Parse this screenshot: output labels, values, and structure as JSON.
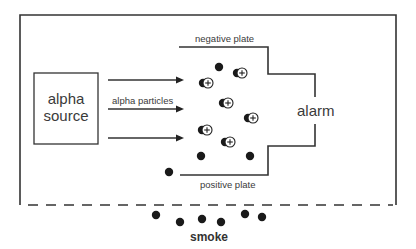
{
  "diagram": {
    "labels": {
      "source": "alpha source",
      "source_line1": "alpha",
      "source_line2": "source",
      "particles": "alpha particles",
      "negative_plate": "negative plate",
      "positive_plate": "positive plate",
      "alarm": "alarm",
      "smoke": "smoke"
    },
    "colors": {
      "line": "#333333",
      "particle": "#1a1a1a",
      "background": "#ffffff"
    },
    "ion_pairs": [
      {
        "x": 208,
        "y": 83
      },
      {
        "x": 242,
        "y": 73
      },
      {
        "x": 228,
        "y": 103
      },
      {
        "x": 253,
        "y": 118
      },
      {
        "x": 207,
        "y": 130
      },
      {
        "x": 230,
        "y": 142
      }
    ],
    "neutral_particles": [
      {
        "x": 219,
        "y": 67
      },
      {
        "x": 201,
        "y": 156
      },
      {
        "x": 250,
        "y": 156
      },
      {
        "x": 169,
        "y": 172
      }
    ],
    "smoke_particles": [
      {
        "x": 156,
        "y": 215
      },
      {
        "x": 180,
        "y": 222
      },
      {
        "x": 202,
        "y": 219
      },
      {
        "x": 221,
        "y": 222
      },
      {
        "x": 245,
        "y": 214
      },
      {
        "x": 262,
        "y": 217
      }
    ]
  }
}
